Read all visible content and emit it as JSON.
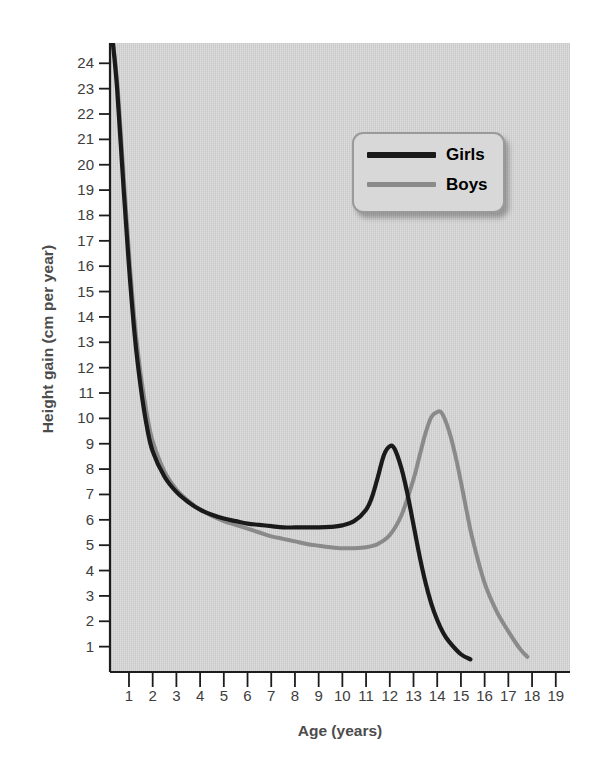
{
  "top_clipped_text": "",
  "chart_data": {
    "type": "line",
    "title": "",
    "xlabel": "Age (years)",
    "ylabel": "Height gain (cm per year)",
    "xlim": [
      0.2,
      19.6
    ],
    "ylim": [
      0,
      24.8
    ],
    "xticks": [
      1,
      2,
      3,
      4,
      5,
      6,
      7,
      8,
      9,
      10,
      11,
      12,
      13,
      14,
      15,
      16,
      17,
      18,
      19
    ],
    "yticks": [
      1,
      2,
      3,
      4,
      5,
      6,
      7,
      8,
      9,
      10,
      11,
      12,
      13,
      14,
      15,
      16,
      17,
      18,
      19,
      20,
      21,
      22,
      23,
      24
    ],
    "grid": false,
    "legend_position": "upper-right-inside",
    "plot_background": "#cecece",
    "series": [
      {
        "name": "Girls",
        "color": "#1a1a1a",
        "x": [
          0.3,
          0.5,
          0.75,
          1.0,
          1.25,
          1.5,
          1.75,
          2.0,
          2.5,
          3.0,
          3.5,
          4.0,
          4.5,
          5.0,
          5.5,
          6.0,
          6.5,
          7.0,
          7.5,
          8.0,
          8.5,
          9.0,
          9.5,
          10.0,
          10.5,
          11.0,
          11.25,
          11.5,
          11.75,
          12.0,
          12.2,
          12.5,
          12.75,
          13.0,
          13.25,
          13.5,
          13.75,
          14.0,
          14.25,
          14.5,
          15.0,
          15.4
        ],
        "y": [
          25.0,
          23.0,
          19.4,
          16.0,
          13.2,
          11.2,
          9.7,
          8.7,
          7.7,
          7.1,
          6.7,
          6.4,
          6.2,
          6.05,
          5.95,
          5.85,
          5.8,
          5.75,
          5.7,
          5.7,
          5.7,
          5.7,
          5.72,
          5.78,
          5.95,
          6.4,
          6.9,
          7.7,
          8.55,
          8.9,
          8.8,
          8.0,
          7.0,
          5.8,
          4.6,
          3.55,
          2.7,
          2.05,
          1.55,
          1.2,
          0.7,
          0.5
        ]
      },
      {
        "name": "Boys",
        "color": "#8a8a8a",
        "x": [
          0.3,
          0.5,
          0.75,
          1.0,
          1.25,
          1.5,
          1.75,
          2.0,
          2.5,
          3.0,
          3.5,
          4.0,
          4.5,
          5.0,
          5.5,
          6.0,
          6.5,
          7.0,
          7.5,
          8.0,
          8.5,
          9.0,
          9.5,
          10.0,
          10.5,
          11.0,
          11.5,
          12.0,
          12.5,
          13.0,
          13.25,
          13.5,
          13.75,
          14.0,
          14.2,
          14.5,
          14.75,
          15.0,
          15.25,
          15.5,
          16.0,
          16.5,
          17.0,
          17.5,
          17.8
        ],
        "y": [
          25.0,
          23.3,
          19.9,
          16.5,
          13.7,
          11.7,
          10.2,
          9.1,
          7.9,
          7.2,
          6.75,
          6.4,
          6.15,
          5.95,
          5.8,
          5.65,
          5.5,
          5.35,
          5.25,
          5.15,
          5.05,
          4.98,
          4.92,
          4.88,
          4.88,
          4.92,
          5.05,
          5.4,
          6.2,
          7.6,
          8.5,
          9.4,
          10.05,
          10.25,
          10.2,
          9.5,
          8.6,
          7.5,
          6.3,
          5.2,
          3.5,
          2.4,
          1.6,
          0.9,
          0.6
        ]
      }
    ],
    "annotations": {
      "girls_peak": {
        "age": 12.0,
        "value": 8.9
      },
      "boys_peak": {
        "age": 14.0,
        "value": 10.25
      }
    }
  },
  "legend": {
    "items": [
      {
        "label": "Girls",
        "color": "#1a1a1a"
      },
      {
        "label": "Boys",
        "color": "#8a8a8a"
      }
    ]
  },
  "colors": {
    "girls": "#1a1a1a",
    "boys": "#8a8a8a",
    "plot_bg": "#cecece",
    "axis": "#1c1c1c",
    "text": "#3d3d3d",
    "title_text": "#4c4c4c",
    "legend_bg": "#d8d8d8",
    "legend_border": "#9a9a9a"
  }
}
